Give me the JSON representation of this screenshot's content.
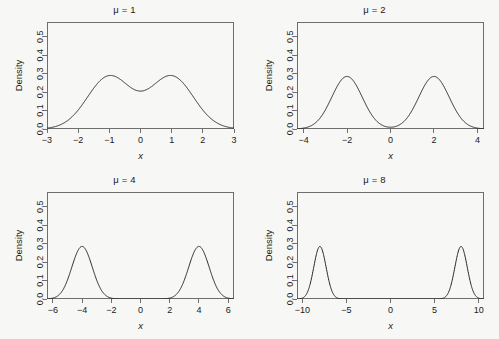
{
  "figure": {
    "background_color": "#f7f7f5",
    "frame_color": "#6e6e6e",
    "curve_color": "#262626",
    "layout": "2x2-grid"
  },
  "chart_data": [
    {
      "type": "line",
      "title": "μ = 1",
      "xlabel": "x",
      "ylabel": "Density",
      "xlim": [
        -3,
        3
      ],
      "ylim": [
        0,
        0.58
      ],
      "xticks": [
        -3,
        -2,
        -1,
        0,
        1,
        2,
        3
      ],
      "xticklabels": [
        "−3",
        "−2",
        "−1",
        "0",
        "1",
        "2",
        "3"
      ],
      "yticks": [
        0.0,
        0.1,
        0.2,
        0.3,
        0.4,
        0.5
      ],
      "yticklabels": [
        "0.0",
        "0.1",
        "0.2",
        "0.3",
        "0.4",
        "0.5"
      ],
      "grid": false,
      "legend": false,
      "mixture": {
        "mu": 1,
        "sigma": 0.7,
        "weights": [
          0.5,
          0.5
        ],
        "means": [
          -1,
          1
        ]
      },
      "peak_density": 0.55,
      "peak_positions": [
        -1,
        1
      ]
    },
    {
      "type": "line",
      "title": "μ = 2",
      "xlabel": "x",
      "ylabel": "Density",
      "xlim": [
        -4.3,
        4.3
      ],
      "ylim": [
        0,
        0.58
      ],
      "xticks": [
        -4,
        -2,
        0,
        2,
        4
      ],
      "xticklabels": [
        "−4",
        "−2",
        "0",
        "2",
        "4"
      ],
      "yticks": [
        0.0,
        0.1,
        0.2,
        0.3,
        0.4,
        0.5
      ],
      "yticklabels": [
        "0.0",
        "0.1",
        "0.2",
        "0.3",
        "0.4",
        "0.5"
      ],
      "grid": false,
      "legend": false,
      "mixture": {
        "mu": 2,
        "sigma": 0.7,
        "weights": [
          0.5,
          0.5
        ],
        "means": [
          -2,
          2
        ]
      },
      "peak_density": 0.55,
      "peak_positions": [
        -2,
        2
      ]
    },
    {
      "type": "line",
      "title": "μ = 4",
      "xlabel": "x",
      "ylabel": "Density",
      "xlim": [
        -6.4,
        6.4
      ],
      "ylim": [
        0,
        0.58
      ],
      "xticks": [
        -6,
        -4,
        -2,
        0,
        2,
        4,
        6
      ],
      "xticklabels": [
        "−6",
        "−4",
        "−2",
        "0",
        "2",
        "4",
        "6"
      ],
      "yticks": [
        0.0,
        0.1,
        0.2,
        0.3,
        0.4,
        0.5
      ],
      "yticklabels": [
        "0.0",
        "0.1",
        "0.2",
        "0.3",
        "0.4",
        "0.5"
      ],
      "grid": false,
      "legend": false,
      "mixture": {
        "mu": 4,
        "sigma": 0.7,
        "weights": [
          0.5,
          0.5
        ],
        "means": [
          -4,
          4
        ]
      },
      "peak_density": 0.55,
      "peak_positions": [
        -4,
        4
      ]
    },
    {
      "type": "line",
      "title": "μ = 8",
      "xlabel": "x",
      "ylabel": "Density",
      "xlim": [
        -10.6,
        10.6
      ],
      "ylim": [
        0,
        0.58
      ],
      "xticks": [
        -10,
        -5,
        0,
        5,
        10
      ],
      "xticklabels": [
        "−10",
        "−5",
        "0",
        "5",
        "10"
      ],
      "yticks": [
        0.0,
        0.1,
        0.2,
        0.3,
        0.4,
        0.5
      ],
      "yticklabels": [
        "0.0",
        "0.1",
        "0.2",
        "0.3",
        "0.4",
        "0.5"
      ],
      "grid": false,
      "legend": false,
      "mixture": {
        "mu": 8,
        "sigma": 0.7,
        "weights": [
          0.5,
          0.5
        ],
        "means": [
          -8,
          8
        ]
      },
      "peak_density": 0.55,
      "peak_positions": [
        -8,
        8
      ]
    }
  ]
}
